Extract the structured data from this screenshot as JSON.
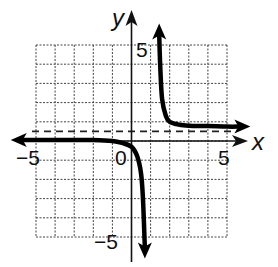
{
  "chart_data": {
    "type": "line",
    "title": "",
    "xlabel": "x",
    "ylabel": "y",
    "xlim": [
      -5,
      5
    ],
    "ylim": [
      -5,
      5
    ],
    "grid": true,
    "grid_step": 1,
    "tick_labels": {
      "x": [
        "-5",
        "0",
        "5"
      ],
      "y": [
        "5",
        "-5"
      ]
    },
    "origin_label": "0",
    "asymptotes": {
      "horizontal": 0.5,
      "vertical": 1
    },
    "series": [
      {
        "name": "left branch",
        "x": [
          -5.8,
          -5,
          -4,
          -3,
          -2,
          -1,
          -0.5,
          0,
          0.3,
          0.5,
          0.6,
          0.7
        ],
        "y": [
          0.05,
          0.05,
          0.05,
          0.05,
          0.05,
          0.0,
          -0.1,
          -0.3,
          -0.8,
          -1.7,
          -3,
          -5.6
        ]
      },
      {
        "name": "right branch",
        "x": [
          1.45,
          1.5,
          1.6,
          1.8,
          2,
          2.5,
          3,
          4,
          5,
          5.7
        ],
        "y": [
          5.6,
          4,
          2.2,
          1.3,
          1.0,
          0.85,
          0.8,
          0.78,
          0.75,
          0.75
        ]
      }
    ]
  },
  "labels": {
    "x_axis": "x",
    "y_axis": "y",
    "x_min": "−5",
    "x_max": "5",
    "y_max": "5",
    "y_min": "−5",
    "origin": "0"
  }
}
